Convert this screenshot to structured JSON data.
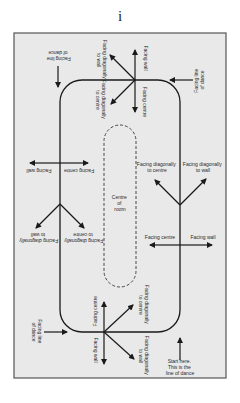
{
  "page": {
    "number": "i"
  },
  "diagram": {
    "background": "#e9e9e9",
    "border": "#555555",
    "line": "#1a1a1a",
    "centre": {
      "line1": "Centre",
      "line2": "of",
      "line3": "room"
    },
    "top_left": {
      "line1": "Facing line",
      "line2": "of dance"
    },
    "top_right": {
      "line1": "Facing line",
      "line2": "of dance"
    },
    "bottom_left": {
      "line1": "Facing line",
      "line2": "of dance"
    },
    "start": {
      "line1": "Start here.",
      "line2": "This is the",
      "line3": "line of dance"
    },
    "top_cluster": {
      "diag_wall_1": "Facing diagonally",
      "diag_wall_2": "to wall",
      "wall": "Facing wall",
      "diag_centre_1": "Facing diagonally",
      "diag_centre_2": "to centre",
      "centre": "Facing centre"
    },
    "left_cluster": {
      "wall": "Facing wall",
      "centre": "Facing centre",
      "diag_wall_1": "Facing diagonally",
      "diag_wall_2": "to wall",
      "diag_centre_1": "Facing diagonally",
      "diag_centre_2": "to centre"
    },
    "right_cluster": {
      "diag_centre_1": "Facing diagonally",
      "diag_centre_2": "to centre",
      "diag_wall_1": "Facing diagonally",
      "diag_wall_2": "to wall",
      "centre": "Facing centre",
      "wall": "Facing wall"
    },
    "bottom_cluster": {
      "centre": "Facing centre",
      "wall": "Facing wall",
      "diag_centre_1": "Facing diagonally",
      "diag_centre_2": "to centre",
      "diag_wall_1": "Facing diagonally",
      "diag_wall_2": "to wall"
    }
  }
}
